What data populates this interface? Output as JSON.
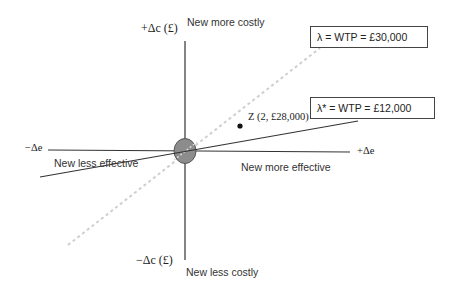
{
  "axes": {
    "y_positive": "+Δc (£)",
    "y_negative": "−Δc (£)",
    "x_positive": "+Δe",
    "x_negative": "−Δe"
  },
  "quadrant_labels": {
    "top": "New more costly",
    "bottom": "New less costly",
    "left": "New less effective",
    "right": "New more effective"
  },
  "thresholds": [
    {
      "name": "lambda",
      "label": "λ = WTP = £30,000",
      "style": "dashed",
      "color": "#cfcfcf"
    },
    {
      "name": "lambda-star",
      "label": "λ* = WTP = £12,000",
      "style": "solid",
      "color": "#333333"
    }
  ],
  "point": {
    "label": "Z (2, £28,000)"
  },
  "colors": {
    "axis": "#333333",
    "origin_fill": "#8c8c8c",
    "dashed_line": "#cfcfcf"
  }
}
